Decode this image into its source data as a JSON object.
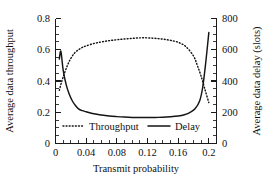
{
  "chart_data": {
    "type": "line",
    "title": "",
    "xlabel": "Transmit probability",
    "ylabel": "Average data throughput",
    "y2label": "Average data delay (slots)",
    "xlim": [
      0,
      0.21
    ],
    "ylim": [
      0,
      0.8
    ],
    "y2lim": [
      0,
      800
    ],
    "grid": false,
    "legend_position": "inside-bottom-center",
    "xticks": [
      0,
      0.04,
      0.08,
      0.12,
      0.16,
      0.2
    ],
    "xticklabels": [
      "0",
      "0.04",
      "0.08",
      "0.12",
      "0.16",
      "0.2"
    ],
    "xminor_step": 0.01,
    "yticks": [
      0,
      0.2,
      0.4,
      0.6,
      0.8
    ],
    "yticklabels": [
      "0",
      "0.2",
      "0.4",
      "0.6",
      "0.8"
    ],
    "y2ticks": [
      0,
      200,
      400,
      600,
      800
    ],
    "y2ticklabels": [
      "0",
      "200",
      "400",
      "600",
      "800"
    ],
    "series": [
      {
        "name": "Throughput",
        "axis": "left",
        "style": "dotted",
        "color": "#141414",
        "x": [
          0.005,
          0.008,
          0.012,
          0.016,
          0.02,
          0.025,
          0.03,
          0.035,
          0.04,
          0.05,
          0.06,
          0.07,
          0.08,
          0.09,
          0.1,
          0.11,
          0.12,
          0.13,
          0.14,
          0.15,
          0.16,
          0.17,
          0.18,
          0.185,
          0.19,
          0.195,
          0.2
        ],
        "y": [
          0.34,
          0.395,
          0.455,
          0.505,
          0.545,
          0.58,
          0.6,
          0.615,
          0.625,
          0.64,
          0.65,
          0.658,
          0.664,
          0.669,
          0.673,
          0.676,
          0.676,
          0.673,
          0.668,
          0.66,
          0.648,
          0.62,
          0.56,
          0.5,
          0.43,
          0.345,
          0.262
        ]
      },
      {
        "name": "Delay",
        "axis": "right",
        "style": "solid",
        "color": "#141414",
        "x": [
          0.005,
          0.007,
          0.01,
          0.014,
          0.018,
          0.022,
          0.026,
          0.03,
          0.035,
          0.04,
          0.05,
          0.06,
          0.07,
          0.08,
          0.09,
          0.1,
          0.11,
          0.12,
          0.13,
          0.14,
          0.15,
          0.16,
          0.168,
          0.175,
          0.182,
          0.188,
          0.192,
          0.196,
          0.2
        ],
        "y": [
          540,
          590,
          470,
          375,
          315,
          272,
          243,
          222,
          210,
          203,
          190,
          182,
          176,
          172,
          169,
          167,
          166,
          166,
          167,
          168,
          171,
          176,
          184,
          198,
          222,
          272,
          360,
          520,
          710
        ]
      }
    ],
    "annotations": []
  },
  "legend": {
    "items": [
      {
        "label": "Throughput",
        "style": "dotted"
      },
      {
        "label": "Delay",
        "style": "solid"
      }
    ]
  }
}
